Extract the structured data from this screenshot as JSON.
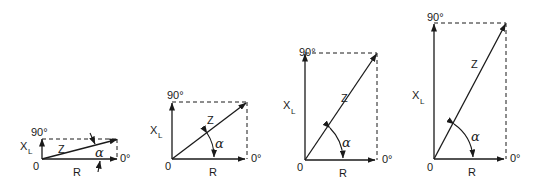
{
  "figure": {
    "labels": {
      "reactance": "X",
      "reactance_sub": "L",
      "impedance": "Z",
      "resistance": "R",
      "angle": "α",
      "origin": "0",
      "deg90": "90°",
      "deg0": "0°"
    },
    "diagrams": [
      {
        "id": 1,
        "origin": [
          42,
          159
        ],
        "R_end": [
          117,
          159
        ],
        "top_y": 139
      },
      {
        "id": 2,
        "origin": [
          172,
          159
        ],
        "R_end": [
          247,
          159
        ],
        "top_y": 102
      },
      {
        "id": 3,
        "origin": [
          305,
          160
        ],
        "R_end": [
          377,
          160
        ],
        "top_y": 53
      },
      {
        "id": 4,
        "origin": [
          434,
          159
        ],
        "R_end": [
          506,
          159
        ],
        "top_y": 23
      }
    ]
  }
}
